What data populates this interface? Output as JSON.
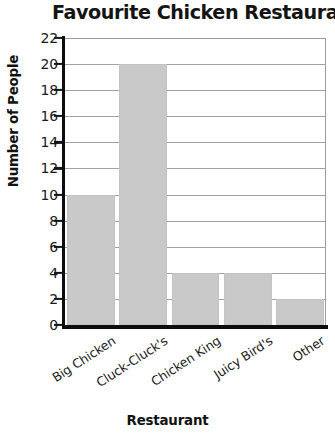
{
  "chart_data": {
    "type": "bar",
    "title": "Favourite Chicken Restaurant",
    "xlabel": "Restaurant",
    "ylabel": "Number of People",
    "categories": [
      "Big Chicken",
      "Cluck-Cluck's",
      "Chicken King",
      "Juicy Bird's",
      "Other"
    ],
    "values": [
      10,
      20,
      4,
      4,
      2
    ],
    "ylim": [
      0,
      22
    ],
    "ytick_step": 2,
    "yticks": [
      0,
      2,
      4,
      6,
      8,
      10,
      12,
      14,
      16,
      18,
      20,
      22
    ],
    "ytick_labels": [
      "0",
      "2",
      "4",
      "6",
      "8",
      "10",
      "12",
      "14",
      "16",
      "18",
      "20",
      "22"
    ],
    "grid": "horizontal",
    "legend": "none",
    "bar_color": "#c9c9c9",
    "gridline_color": "#a2a2a2",
    "axis_color": "#0d0d0d",
    "text_color": "#141414"
  }
}
